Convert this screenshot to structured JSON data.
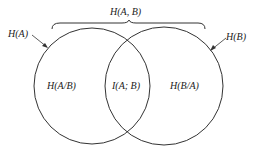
{
  "diagram": {
    "type": "venn",
    "joint_label": "H(A, B)",
    "left_circle_label": "H(A)",
    "right_circle_label": "H(B)",
    "left_only_label": "H(A/B)",
    "intersection_label": "I(A; B)",
    "right_only_label": "H(B/A)",
    "stroke_color": "#333333"
  }
}
